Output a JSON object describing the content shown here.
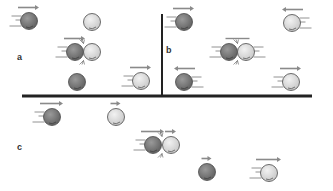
{
  "figure": {
    "colors": {
      "dark_ball": "#7a7a7a",
      "light_ball": "#dcdcdc",
      "ball_outline": "#4a4a4a",
      "arrow": "#8a8a8a",
      "divider": "#222222",
      "speed_lines": "#777777"
    },
    "panels": [
      {
        "id": "a",
        "label": "a",
        "label_pos": [
          19,
          59
        ],
        "states": [
          {
            "stage": "before",
            "balls": [
              {
                "type": "dark",
                "x": 29,
                "y": 21,
                "arrow": "right",
                "arrow_len": 18,
                "motion": true
              },
              {
                "type": "light",
                "x": 92,
                "y": 22,
                "arrow": null,
                "motion": false
              }
            ]
          },
          {
            "stage": "collision",
            "balls": [
              {
                "type": "dark",
                "x": 75,
                "y": 52,
                "arrow": "right",
                "arrow_len": 18,
                "motion": true
              },
              {
                "type": "light",
                "x": 92,
                "y": 52,
                "arrow": null,
                "motion": false
              }
            ]
          },
          {
            "stage": "after",
            "balls": [
              {
                "type": "dark",
                "x": 77,
                "y": 82,
                "arrow": null,
                "motion": false
              },
              {
                "type": "light",
                "x": 141,
                "y": 81,
                "arrow": "right",
                "arrow_len": 18,
                "motion": true
              }
            ]
          }
        ]
      },
      {
        "id": "b",
        "label": "b",
        "label_pos": [
          168,
          52
        ],
        "states": [
          {
            "stage": "before",
            "balls": [
              {
                "type": "dark",
                "x": 184,
                "y": 22,
                "arrow": "right",
                "arrow_len": 18,
                "motion": true
              },
              {
                "type": "light",
                "x": 292,
                "y": 23,
                "arrow": "left",
                "arrow_len": 18,
                "motion": true
              }
            ]
          },
          {
            "stage": "collision",
            "balls": [
              {
                "type": "dark",
                "x": 229,
                "y": 52,
                "arrow": null,
                "motion": true
              },
              {
                "type": "light",
                "x": 246,
                "y": 52,
                "arrow": null,
                "motion": true
              }
            ]
          },
          {
            "stage": "after",
            "balls": [
              {
                "type": "dark",
                "x": 184,
                "y": 82,
                "arrow": "left",
                "arrow_len": 18,
                "motion": true
              },
              {
                "type": "light",
                "x": 291,
                "y": 82,
                "arrow": "right",
                "arrow_len": 18,
                "motion": true
              }
            ]
          }
        ]
      },
      {
        "id": "c",
        "label": "c",
        "label_pos": [
          19,
          149
        ],
        "states": [
          {
            "stage": "before",
            "balls": [
              {
                "type": "dark",
                "x": 52,
                "y": 117,
                "arrow": "right",
                "arrow_len": 20,
                "motion": true
              },
              {
                "type": "light",
                "x": 116,
                "y": 117,
                "arrow": "right",
                "arrow_len": 7,
                "motion": false
              }
            ]
          },
          {
            "stage": "collision",
            "balls": [
              {
                "type": "dark",
                "x": 153,
                "y": 145,
                "arrow": "right",
                "arrow_len": 20,
                "motion": true
              },
              {
                "type": "light",
                "x": 171,
                "y": 145,
                "arrow": "right",
                "arrow_len": 8,
                "motion": false
              }
            ]
          },
          {
            "stage": "after",
            "balls": [
              {
                "type": "dark",
                "x": 207,
                "y": 172,
                "arrow": "right",
                "arrow_len": 7,
                "motion": false
              },
              {
                "type": "light",
                "x": 269,
                "y": 173,
                "arrow": "right",
                "arrow_len": 22,
                "motion": true
              }
            ]
          }
        ]
      }
    ],
    "dividers": {
      "vertical": {
        "x": 162,
        "y1": 14,
        "y2": 95
      },
      "horizontal": {
        "y": 96,
        "x1": 22,
        "x2": 312
      }
    }
  }
}
